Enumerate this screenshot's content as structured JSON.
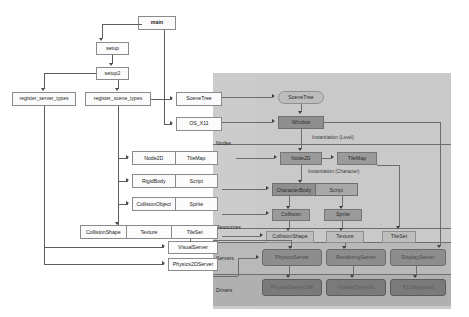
{
  "diagram": {
    "type": "flowchart",
    "colors": {
      "canvas": "#ffffff",
      "panel": "#c9c9c9",
      "servers_band": "#b9b9b9",
      "drivers_band": "#b0b0b0",
      "node_fill": "#fbfbfb",
      "node_border": "#8a8a8a",
      "gray_node_light": "#bdbdbd",
      "gray_node_mid": "#9a9a9a",
      "gray_node_dark": "#8e8e8e",
      "server_fill": "#8d8d8d",
      "driver_fill": "#7a7a7a",
      "connector": "#5d5d5d"
    }
  },
  "init_chain": {
    "main": "main",
    "setup": "setup",
    "setup2": "setup2",
    "register_server_types": "register_server_types",
    "register_scene_types": "register_scene_types"
  },
  "registered": {
    "scene_tree": "SceneTree",
    "os_x11": "OS_X11",
    "rows": [
      {
        "left": "Node2D",
        "right": "TileMap"
      },
      {
        "left": "RigidBody",
        "right": "Script"
      },
      {
        "left": "CollisionObject",
        "right": "Sprite"
      }
    ],
    "resources_row": [
      "CollisionShape",
      "Texture",
      "TileSet"
    ],
    "servers": [
      "VisualServer",
      "Physics2DServer"
    ]
  },
  "lanes": {
    "nodes": "Nodes",
    "resources": "Resources",
    "servers": "Servers",
    "drivers": "Drivers"
  },
  "runtime": {
    "scene_tree": "SceneTree",
    "window": "Window",
    "node2d": "Node2D",
    "tilemap": "TileMap",
    "character_body": "CharacterBody",
    "script": "Script",
    "collision": "Collision",
    "sprite": "Sprite",
    "collision_shape": "CollisionShape",
    "texture": "Texture",
    "tileset": "TileSet",
    "annotations": {
      "level": "Instantiation (Level)",
      "character": "Instantiation (Character)"
    },
    "servers": [
      "PhysicsServer",
      "RenderingServer",
      "DisplayServer"
    ],
    "drivers": [
      "PhysicsServerSW",
      "Vulkan/OpenGL",
      "X11/Wayland"
    ]
  }
}
